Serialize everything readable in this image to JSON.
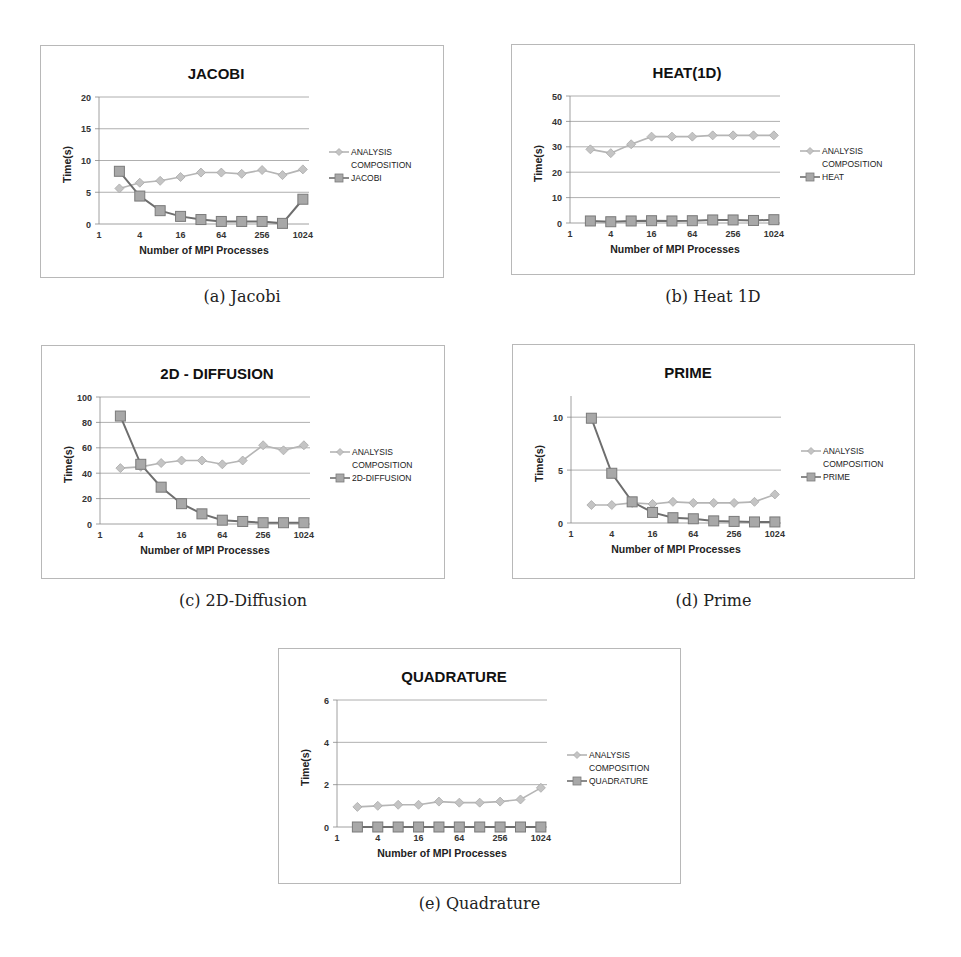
{
  "chart_data": [
    {
      "id": "jacobi",
      "type": "line",
      "title": "JACOBI",
      "caption": "(a) Jacobi",
      "xlabel": "Number of MPI Processes",
      "ylabel": "Time(s)",
      "xscale": "log2",
      "x_tick_labels": [
        "1",
        "4",
        "16",
        "64",
        "256",
        "1024"
      ],
      "x": [
        2,
        4,
        8,
        16,
        32,
        64,
        128,
        256,
        512,
        1024
      ],
      "ylim": [
        0,
        20
      ],
      "y_ticks": [
        0,
        5,
        10,
        15,
        20
      ],
      "grid": true,
      "legend_position": "right",
      "series": [
        {
          "name": "ANALYSIS COMPOSITION",
          "legend_lines": [
            "ANALYSIS",
            "COMPOSITION"
          ],
          "marker": "diamond",
          "color": "#b5b5b5",
          "values": [
            5.6,
            6.5,
            6.8,
            7.4,
            8.1,
            8.1,
            7.9,
            8.5,
            7.7,
            8.6
          ]
        },
        {
          "name": "JACOBI",
          "legend_lines": [
            "JACOBI"
          ],
          "marker": "square",
          "color": "#6e6e6e",
          "values": [
            8.3,
            4.4,
            2.1,
            1.2,
            0.7,
            0.4,
            0.4,
            0.4,
            0.1,
            3.9
          ]
        }
      ]
    },
    {
      "id": "heat",
      "type": "line",
      "title": "HEAT(1D)",
      "caption": "(b) Heat 1D",
      "xlabel": "Number of MPI Processes",
      "ylabel": "Time(s)",
      "xscale": "log2",
      "x_tick_labels": [
        "1",
        "4",
        "16",
        "64",
        "256",
        "1024"
      ],
      "x": [
        2,
        4,
        8,
        16,
        32,
        64,
        128,
        256,
        512,
        1024
      ],
      "ylim": [
        0,
        50
      ],
      "y_ticks": [
        0,
        10,
        20,
        30,
        40,
        50
      ],
      "grid": true,
      "legend_position": "right",
      "series": [
        {
          "name": "ANALYSIS COMPOSITION",
          "legend_lines": [
            "ANALYSIS",
            "COMPOSITION"
          ],
          "marker": "diamond",
          "color": "#b5b5b5",
          "values": [
            29,
            27.5,
            31,
            34,
            34,
            34,
            34.5,
            34.5,
            34.5,
            34.5
          ]
        },
        {
          "name": "HEAT",
          "legend_lines": [
            "HEAT"
          ],
          "marker": "square",
          "color": "#6e6e6e",
          "values": [
            0.8,
            0.5,
            0.8,
            0.9,
            0.8,
            0.9,
            1.2,
            1.2,
            1.0,
            1.3
          ]
        }
      ]
    },
    {
      "id": "diffusion",
      "type": "line",
      "title": "2D - DIFFUSION",
      "caption": "(c) 2D-Diffusion",
      "xlabel": "Number of MPI Processes",
      "ylabel": "Time(s)",
      "xscale": "log2",
      "x_tick_labels": [
        "1",
        "4",
        "16",
        "64",
        "256",
        "1024"
      ],
      "x": [
        2,
        4,
        8,
        16,
        32,
        64,
        128,
        256,
        512,
        1024
      ],
      "ylim": [
        0,
        100
      ],
      "y_ticks": [
        0,
        20,
        40,
        60,
        80,
        100
      ],
      "grid": true,
      "legend_position": "right",
      "series": [
        {
          "name": "ANALYSIS COMPOSITION",
          "legend_lines": [
            "ANALYSIS",
            "COMPOSITION"
          ],
          "marker": "diamond",
          "color": "#b5b5b5",
          "values": [
            44,
            45,
            48,
            50,
            50,
            47,
            50,
            62,
            58,
            62
          ]
        },
        {
          "name": "2D-DIFFUSION",
          "legend_lines": [
            "2D-DIFFUSION"
          ],
          "marker": "square",
          "color": "#6e6e6e",
          "values": [
            85,
            47,
            29,
            16,
            8,
            3,
            2,
            1,
            1,
            1
          ]
        }
      ]
    },
    {
      "id": "prime",
      "type": "line",
      "title": "PRIME",
      "caption": "(d) Prime",
      "xlabel": "Number of MPI Processes",
      "ylabel": "Time(s)",
      "xscale": "log2",
      "x_tick_labels": [
        "1",
        "4",
        "16",
        "64",
        "256",
        "1024"
      ],
      "x": [
        2,
        4,
        8,
        16,
        32,
        64,
        128,
        256,
        512,
        1024
      ],
      "ylim": [
        0,
        12
      ],
      "y_ticks": [
        0,
        5,
        10
      ],
      "grid": true,
      "legend_position": "right",
      "series": [
        {
          "name": "ANALYSIS COMPOSITION",
          "legend_lines": [
            "ANALYSIS",
            "COMPOSITION"
          ],
          "marker": "diamond",
          "color": "#b5b5b5",
          "values": [
            1.7,
            1.7,
            1.9,
            1.8,
            2.0,
            1.9,
            1.9,
            1.9,
            2.0,
            2.7
          ]
        },
        {
          "name": "PRIME",
          "legend_lines": [
            "PRIME"
          ],
          "marker": "square",
          "color": "#6e6e6e",
          "values": [
            9.9,
            4.7,
            2.0,
            1.0,
            0.5,
            0.4,
            0.2,
            0.15,
            0.1,
            0.1
          ]
        }
      ]
    },
    {
      "id": "quadrature",
      "type": "line",
      "title": "QUADRATURE",
      "caption": "(e) Quadrature",
      "xlabel": "Number of MPI Processes",
      "ylabel": "Time(s)",
      "xscale": "log2",
      "x_tick_labels": [
        "1",
        "4",
        "16",
        "64",
        "256",
        "1024"
      ],
      "x": [
        2,
        4,
        8,
        16,
        32,
        64,
        128,
        256,
        512,
        1024
      ],
      "ylim": [
        0,
        6
      ],
      "y_ticks": [
        0,
        2,
        4,
        6
      ],
      "grid": true,
      "legend_position": "right",
      "series": [
        {
          "name": "ANALYSIS COMPOSITION",
          "legend_lines": [
            "ANALYSIS",
            "COMPOSITION"
          ],
          "marker": "diamond",
          "color": "#b5b5b5",
          "values": [
            0.95,
            1.0,
            1.05,
            1.05,
            1.2,
            1.15,
            1.15,
            1.2,
            1.3,
            1.85
          ]
        },
        {
          "name": "QUADRATURE",
          "legend_lines": [
            "QUADRATURE"
          ],
          "marker": "square",
          "color": "#6e6e6e",
          "values": [
            0,
            0,
            0,
            0,
            0,
            0,
            0,
            0,
            0,
            0
          ]
        }
      ]
    }
  ]
}
